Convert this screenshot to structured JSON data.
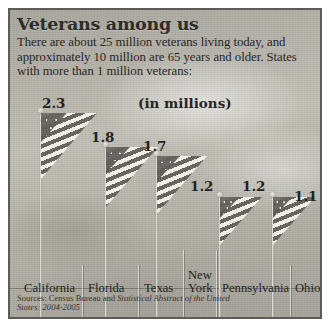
{
  "header": {
    "title": "Veterans among us",
    "deck": "There are about 25 million veterans living today, and approximately 10 million are 65 years and older. States with more than 1 million veterans:"
  },
  "units_label": "(in millions)",
  "source": {
    "prefix": "Sources: Census Bureau and ",
    "italic": "Statistical Abstract of the United States: 2004-2005"
  },
  "colors": {
    "frame": "#5c5c58",
    "background": "#b9b7ae",
    "text": "#23221e",
    "flag_dark": "#605e58",
    "flag_light": "#f2f0e9"
  },
  "chart_data": {
    "type": "bar",
    "title": "Veterans among us",
    "subtitle": "There are about 25 million veterans living today, and approximately 10 million are 65 years and older. States with more than 1 million veterans:",
    "xlabel": "",
    "ylabel": "(in millions)",
    "ylim": [
      0,
      2.5
    ],
    "grid": false,
    "legend": "none",
    "units": "millions",
    "categories": [
      "California",
      "Florida",
      "Texas",
      "New York",
      "Pennsylvania",
      "Ohio"
    ],
    "values": [
      2.3,
      1.8,
      1.7,
      1.2,
      1.2,
      1.1
    ],
    "value_labels": [
      "2.3",
      "1.8",
      "1.7",
      "1.2",
      "1.2",
      "1.1"
    ],
    "marker_style": "american-flag-on-pole",
    "annotations": [
      "(in millions)"
    ]
  },
  "bars": [
    {
      "state": "California",
      "state_line1": "California",
      "state_line2": "",
      "value": "2.3",
      "left": 30,
      "pole_height": 206,
      "flag_w": 56,
      "flag_h": 66,
      "value_left": 32,
      "value_top": 85,
      "label_left": 14,
      "label_top": 272
    },
    {
      "state": "Florida",
      "state_line1": "Florida",
      "state_line2": "",
      "value": "1.8",
      "left": 95,
      "pole_height": 172,
      "flag_w": 52,
      "flag_h": 60,
      "value_left": 81,
      "value_top": 119,
      "label_left": 78,
      "label_top": 272
    },
    {
      "state": "Texas",
      "state_line1": "Texas",
      "state_line2": "",
      "value": "1.7",
      "left": 146,
      "pole_height": 163,
      "flag_w": 50,
      "flag_h": 58,
      "value_left": 133,
      "value_top": 128,
      "label_left": 134,
      "label_top": 272
    },
    {
      "state": "New York",
      "state_line1": "New",
      "state_line2": "York",
      "value": "1.2",
      "left": 209,
      "pole_height": 122,
      "flag_w": 42,
      "flag_h": 48,
      "value_left": 180,
      "value_top": 168,
      "label_left": 178,
      "label_top": 259
    },
    {
      "state": "Pennsylvania",
      "state_line1": "Pennsylvania",
      "state_line2": "",
      "value": "1.2",
      "left": 262,
      "pole_height": 122,
      "flag_w": 42,
      "flag_h": 48,
      "value_left": 232,
      "value_top": 168,
      "label_left": 212,
      "label_top": 272
    },
    {
      "state": "Ohio",
      "state_line1": "Ohio",
      "state_line2": "",
      "value": "1.1",
      "left": 314,
      "pole_height": 112,
      "flag_w": 40,
      "flag_h": 46,
      "value_left": 284,
      "value_top": 178,
      "label_left": 285,
      "label_top": 272
    }
  ],
  "separators": [
    {
      "left": 72,
      "top": 255,
      "height": 56
    },
    {
      "left": 128,
      "top": 255,
      "height": 56
    },
    {
      "left": 173,
      "top": 240,
      "height": 71
    },
    {
      "left": 206,
      "top": 240,
      "height": 71
    },
    {
      "left": 280,
      "top": 255,
      "height": 56
    }
  ]
}
